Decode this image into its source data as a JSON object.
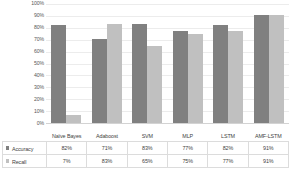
{
  "chart_data": {
    "type": "bar",
    "title": "",
    "xlabel": "",
    "ylabel": "",
    "ylim": [
      0,
      100
    ],
    "grid": true,
    "legend_position": "table-row-headers",
    "categories": [
      "Naïve Bayes",
      "Adaboost",
      "SVM",
      "MLP",
      "LSTM",
      "AMF-LSTM"
    ],
    "y_ticks": [
      "0%",
      "10%",
      "20%",
      "30%",
      "40%",
      "50%",
      "60%",
      "70%",
      "80%",
      "90%",
      "100%"
    ],
    "y_tick_values": [
      0,
      10,
      20,
      30,
      40,
      50,
      60,
      70,
      80,
      90,
      100
    ],
    "series": [
      {
        "name": "Accuracy",
        "color": "#808080",
        "values": [
          82,
          71,
          83,
          77,
          82,
          91
        ],
        "labels": [
          "82%",
          "71%",
          "83%",
          "77%",
          "82%",
          "91%"
        ]
      },
      {
        "name": "Recall",
        "color": "#c0c0c0",
        "values": [
          7,
          83,
          65,
          75,
          77,
          91
        ],
        "labels": [
          "7%",
          "83%",
          "65%",
          "75%",
          "77%",
          "91%"
        ]
      }
    ]
  },
  "table": {
    "corner_label": ""
  }
}
